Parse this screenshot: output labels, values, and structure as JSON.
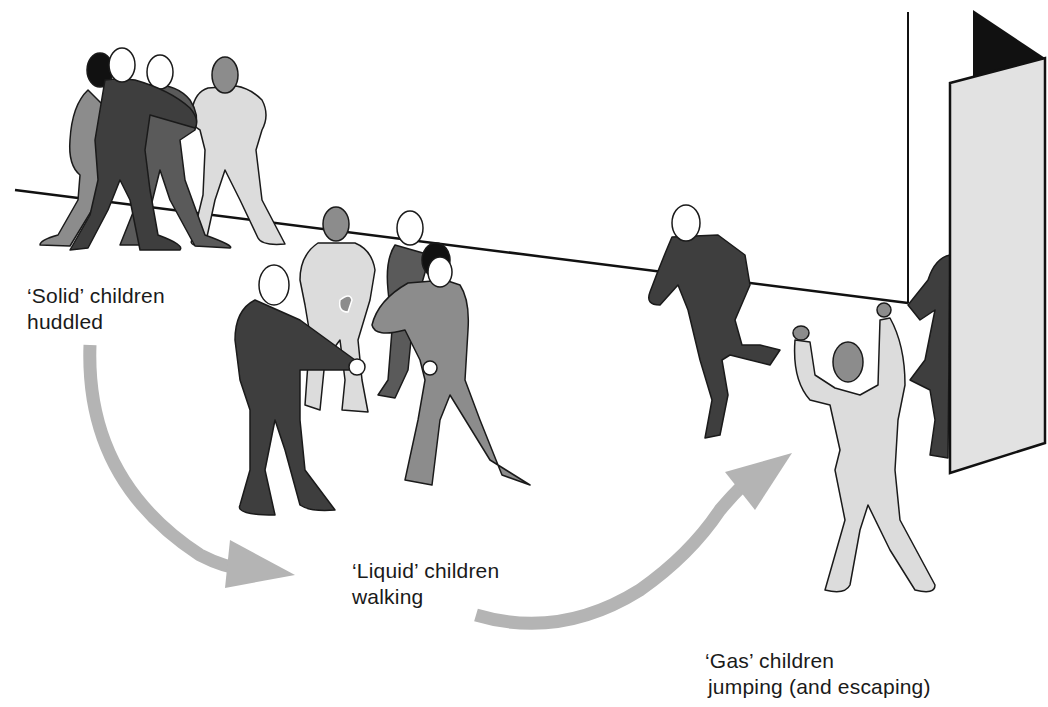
{
  "diagram": {
    "topic": "States of matter analogy with children",
    "labels": {
      "solid": {
        "line1": "‘Solid’ children",
        "line2": "huddled"
      },
      "liquid": {
        "line1": "‘Liquid’ children",
        "line2": "walking"
      },
      "gas": {
        "line1": "‘Gas’ children",
        "line2": "jumping (and escaping)"
      }
    },
    "groups": [
      {
        "state": "solid",
        "count": 4,
        "pose": "huddled"
      },
      {
        "state": "liquid",
        "count": 4,
        "pose": "walking"
      },
      {
        "state": "gas",
        "count": 3,
        "pose": "jumping / escaping through door"
      }
    ],
    "arrows": [
      {
        "from": "solid",
        "to": "liquid"
      },
      {
        "from": "liquid",
        "to": "gas"
      }
    ],
    "colors": {
      "dark": "#4a4a4a",
      "mid": "#8c8c8c",
      "light": "#dcdcdc",
      "arrow": "#b4b4b4",
      "outline": "#1a1a1a",
      "door": "#e2e2e2"
    }
  }
}
